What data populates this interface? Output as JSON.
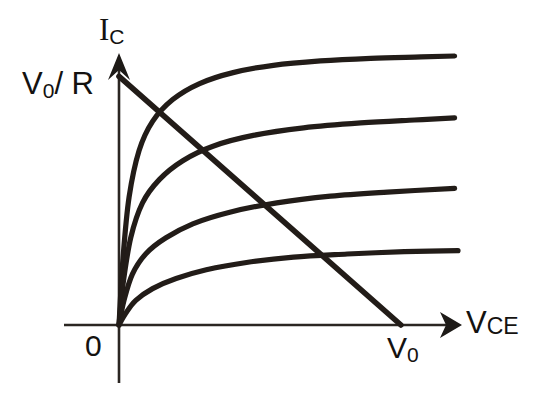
{
  "figure": {
    "background_color": "#ffffff",
    "line_color": "#221c18",
    "axis_color": "#2b2622"
  },
  "labels": {
    "y_axis": {
      "base": "I",
      "subscript": "C",
      "full": "IC"
    },
    "y_intercept": {
      "text": "V0/R",
      "base_a": "V",
      "subscript_a": "0",
      "separator": "/ R"
    },
    "origin": "0",
    "x_intercept": {
      "base": "V",
      "subscript": "0",
      "full": "V0"
    },
    "x_axis": {
      "base": "V",
      "subscript": "CE",
      "full": "VCE"
    }
  },
  "chart_data": {
    "type": "line",
    "xlabel": "VCE",
    "ylabel": "IC",
    "grid": false,
    "legend": "none",
    "xlim": [
      0,
      1.26
    ],
    "ylim": [
      0,
      1.0
    ],
    "axis_origin_label": "0",
    "x_tick_labels": [
      "0",
      "V0"
    ],
    "y_tick_labels": [
      "0",
      "V0/R"
    ],
    "annotations": [
      {
        "text": "V0/R",
        "x": 0,
        "y": 0.855,
        "position": "left-of-y-axis"
      },
      {
        "text": "V0",
        "x": 0.84,
        "y": 0,
        "position": "below-x-axis"
      },
      {
        "text": "IC",
        "x": 0,
        "y": 1.0,
        "position": "above-y-axis-arrow"
      },
      {
        "text": "VCE",
        "x": 1.26,
        "y": 0,
        "position": "right-of-x-axis-arrow"
      }
    ],
    "series": [
      {
        "name": "IB4 (highest base current)",
        "kind": "output-characteristic",
        "points": [
          [
            0.0,
            0.0
          ],
          [
            0.012,
            0.23
          ],
          [
            0.03,
            0.44
          ],
          [
            0.06,
            0.6
          ],
          [
            0.1,
            0.7
          ],
          [
            0.16,
            0.775
          ],
          [
            0.24,
            0.83
          ],
          [
            0.34,
            0.868
          ],
          [
            0.46,
            0.893
          ],
          [
            0.6,
            0.908
          ],
          [
            0.75,
            0.917
          ],
          [
            0.9,
            0.922
          ],
          [
            1.0,
            0.925
          ]
        ]
      },
      {
        "name": "IB3",
        "kind": "output-characteristic",
        "points": [
          [
            0.0,
            0.0
          ],
          [
            0.012,
            0.14
          ],
          [
            0.035,
            0.3
          ],
          [
            0.07,
            0.42
          ],
          [
            0.12,
            0.5
          ],
          [
            0.19,
            0.565
          ],
          [
            0.28,
            0.615
          ],
          [
            0.4,
            0.652
          ],
          [
            0.55,
            0.678
          ],
          [
            0.72,
            0.695
          ],
          [
            0.88,
            0.705
          ],
          [
            1.0,
            0.712
          ]
        ]
      },
      {
        "name": "IB2",
        "kind": "output-characteristic",
        "points": [
          [
            0.0,
            0.0
          ],
          [
            0.015,
            0.085
          ],
          [
            0.04,
            0.175
          ],
          [
            0.08,
            0.245
          ],
          [
            0.14,
            0.3
          ],
          [
            0.22,
            0.348
          ],
          [
            0.33,
            0.388
          ],
          [
            0.47,
            0.42
          ],
          [
            0.63,
            0.443
          ],
          [
            0.8,
            0.457
          ],
          [
            1.0,
            0.47
          ]
        ]
      },
      {
        "name": "IB1 (lowest base current)",
        "kind": "output-characteristic",
        "points": [
          [
            0.0,
            0.0
          ],
          [
            0.02,
            0.04
          ],
          [
            0.05,
            0.085
          ],
          [
            0.1,
            0.125
          ],
          [
            0.17,
            0.16
          ],
          [
            0.26,
            0.19
          ],
          [
            0.38,
            0.215
          ],
          [
            0.52,
            0.233
          ],
          [
            0.68,
            0.244
          ],
          [
            0.85,
            0.252
          ],
          [
            1.01,
            0.256
          ]
        ]
      },
      {
        "name": "DC load line",
        "kind": "load-line",
        "points": [
          [
            0.0,
            0.855
          ],
          [
            0.84,
            0.0
          ]
        ]
      }
    ]
  }
}
